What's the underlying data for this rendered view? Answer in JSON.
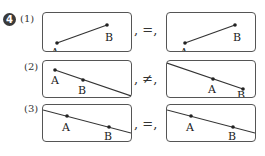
{
  "problem": {
    "number": "4",
    "items": [
      {
        "label": "(1)",
        "relation": "=",
        "left": {
          "line": [
            [
              14,
              30
            ],
            [
              64,
              12
            ]
          ],
          "extend": "none",
          "A": [
            14,
            30
          ],
          "B": [
            64,
            12
          ]
        },
        "right": {
          "line": [
            [
              14,
              30
            ],
            [
              64,
              12
            ]
          ],
          "extend": "none",
          "A": [
            14,
            30
          ],
          "B": [
            64,
            12
          ]
        }
      },
      {
        "label": "(2)",
        "relation": "≠",
        "left": {
          "extend": "ray-from-A",
          "A": [
            11,
            9
          ],
          "B": [
            40,
            20
          ]
        },
        "right": {
          "extend": "ray-to-A",
          "A": [
            46,
            20
          ],
          "B": [
            76,
            28
          ]
        }
      },
      {
        "label": "(3)",
        "relation": "=",
        "left": {
          "extend": "line",
          "A": [
            24,
            12
          ],
          "B": [
            66,
            24
          ]
        },
        "right": {
          "extend": "line",
          "A": [
            24,
            12
          ],
          "B": [
            66,
            24
          ]
        }
      }
    ],
    "point_labels": {
      "a": "A",
      "b": "B"
    },
    "separator": ","
  }
}
